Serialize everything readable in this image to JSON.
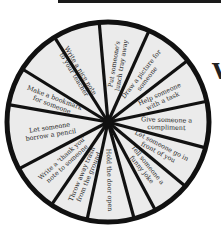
{
  "wheel": {
    "center": [
      108,
      122
    ],
    "radius_x": 101,
    "radius_y": 100,
    "fill_color": "#ebebeb",
    "stroke_color": "#111111",
    "wedges": [
      {
        "lines": [
          "Put someone's",
          "lunch tray away"
        ]
      },
      {
        "lines": [
          "Draw a picture for",
          "someone"
        ]
      },
      {
        "lines": [
          "Help someone",
          "with a task"
        ]
      },
      {
        "lines": [
          "Give someone a",
          "compliment"
        ]
      },
      {
        "lines": [
          "Let someone go in",
          "front of you"
        ]
      },
      {
        "lines": [
          "Tell someone a",
          "funny joke"
        ]
      },
      {
        "lines": [
          "Hold the door open"
        ]
      },
      {
        "lines": [
          "Throw away trash",
          "from the ground"
        ]
      },
      {
        "lines": [
          "Write a 'thank you'",
          "note to someone"
        ]
      },
      {
        "lines": [
          "Let someone",
          "borrow a pencil"
        ]
      },
      {
        "lines": [
          "Make a bookmark",
          "for someone"
        ]
      },
      {
        "lines": [
          "Write a nice note",
          "to your teacher"
        ]
      }
    ]
  },
  "edge_partial_letter": "V"
}
